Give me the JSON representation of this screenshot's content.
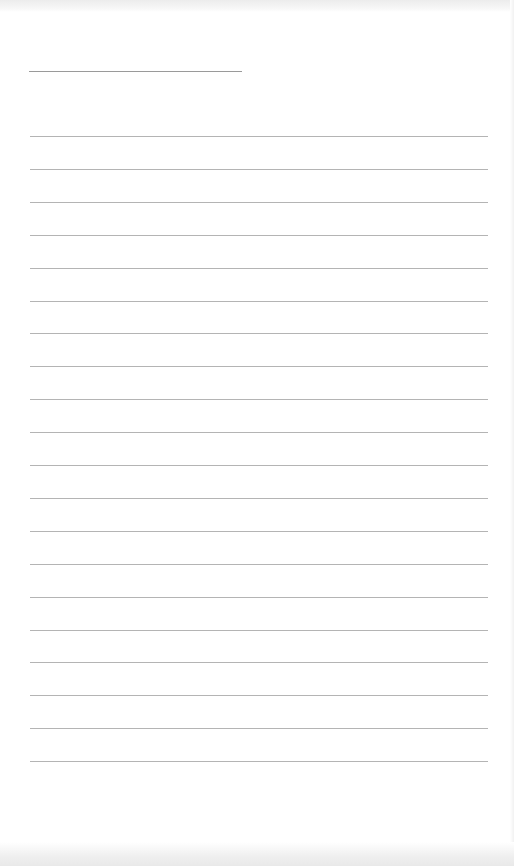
{
  "page": {
    "background": "#ffffff",
    "line_color": "#b4b4b4",
    "title_line": {
      "left": 29,
      "top": 71,
      "width": 213
    },
    "ruled_lines": {
      "count": 20,
      "first_top": 136,
      "spacing": 32.9,
      "left": 30,
      "width": 458
    }
  }
}
